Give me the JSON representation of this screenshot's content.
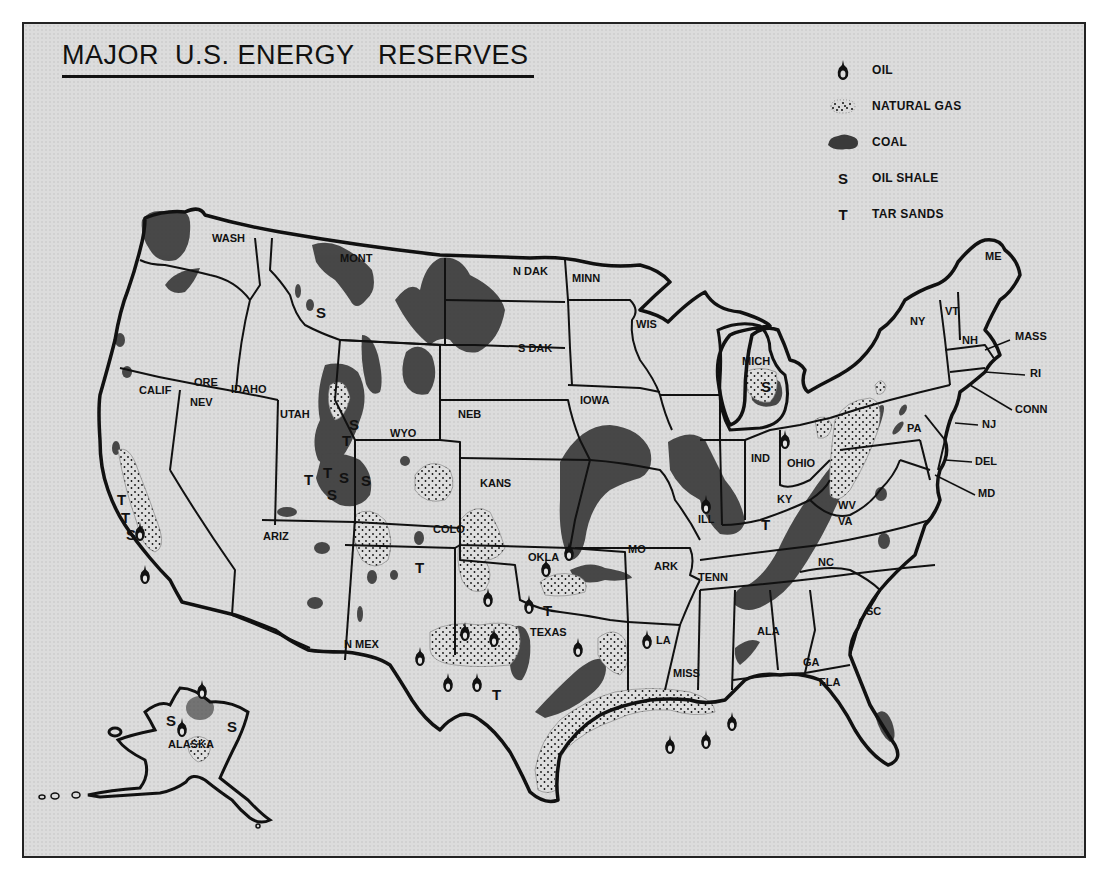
{
  "title": "MAJOR  U.S. ENERGY   RESERVES",
  "legend": {
    "items": [
      {
        "symbol": "oil-drop",
        "label": "OIL"
      },
      {
        "symbol": "dots",
        "label": "NATURAL GAS"
      },
      {
        "symbol": "dark-blob",
        "label": "COAL"
      },
      {
        "symbol": "S",
        "label": "OIL  SHALE"
      },
      {
        "symbol": "T",
        "label": "TAR SANDS"
      }
    ]
  },
  "states": [
    {
      "label": "WASH",
      "x": 212,
      "y": 242
    },
    {
      "label": "MONT",
      "x": 340,
      "y": 262
    },
    {
      "label": "N DAK",
      "x": 513,
      "y": 275
    },
    {
      "label": "MINN",
      "x": 572,
      "y": 282
    },
    {
      "label": "ORE",
      "x": 194,
      "y": 386
    },
    {
      "label": "IDAHO",
      "x": 231,
      "y": 393
    },
    {
      "label": "CALIF",
      "x": 139,
      "y": 394
    },
    {
      "label": "NEV",
      "x": 190,
      "y": 406
    },
    {
      "label": "UTAH",
      "x": 280,
      "y": 418
    },
    {
      "label": "WYO",
      "x": 390,
      "y": 437
    },
    {
      "label": "NEB",
      "x": 458,
      "y": 418
    },
    {
      "label": "S DAK",
      "x": 518,
      "y": 352
    },
    {
      "label": "IOWA",
      "x": 580,
      "y": 404
    },
    {
      "label": "WIS",
      "x": 636,
      "y": 328
    },
    {
      "label": "MICH",
      "x": 742,
      "y": 365
    },
    {
      "label": "NY",
      "x": 910,
      "y": 325
    },
    {
      "label": "VT",
      "x": 945,
      "y": 315
    },
    {
      "label": "NH",
      "x": 962,
      "y": 344
    },
    {
      "label": "ME",
      "x": 985,
      "y": 260
    },
    {
      "label": "MASS",
      "x": 1015,
      "y": 340
    },
    {
      "label": "RI",
      "x": 1030,
      "y": 377
    },
    {
      "label": "CONN",
      "x": 1015,
      "y": 413
    },
    {
      "label": "NJ",
      "x": 982,
      "y": 428
    },
    {
      "label": "DEL",
      "x": 975,
      "y": 465
    },
    {
      "label": "MD",
      "x": 978,
      "y": 497
    },
    {
      "label": "PA",
      "x": 907,
      "y": 432
    },
    {
      "label": "OHIO",
      "x": 787,
      "y": 467
    },
    {
      "label": "IND",
      "x": 751,
      "y": 462
    },
    {
      "label": "ILL",
      "x": 698,
      "y": 523
    },
    {
      "label": "KY",
      "x": 777,
      "y": 503
    },
    {
      "label": "WV",
      "x": 838,
      "y": 509
    },
    {
      "label": "VA",
      "x": 838,
      "y": 525
    },
    {
      "label": "KANS",
      "x": 480,
      "y": 487
    },
    {
      "label": "COLO",
      "x": 433,
      "y": 533
    },
    {
      "label": "OKLA",
      "x": 528,
      "y": 561
    },
    {
      "label": "MO",
      "x": 628,
      "y": 553
    },
    {
      "label": "ARK",
      "x": 654,
      "y": 570
    },
    {
      "label": "TENN",
      "x": 698,
      "y": 581
    },
    {
      "label": "NC",
      "x": 818,
      "y": 566
    },
    {
      "label": "SC",
      "x": 866,
      "y": 615
    },
    {
      "label": "ARIZ",
      "x": 263,
      "y": 540
    },
    {
      "label": "N MEX",
      "x": 344,
      "y": 648
    },
    {
      "label": "TEXAS",
      "x": 530,
      "y": 636
    },
    {
      "label": "LA",
      "x": 656,
      "y": 644
    },
    {
      "label": "MISS",
      "x": 673,
      "y": 677
    },
    {
      "label": "ALA",
      "x": 757,
      "y": 635
    },
    {
      "label": "GA",
      "x": 803,
      "y": 666
    },
    {
      "label": "FLA",
      "x": 819,
      "y": 686
    },
    {
      "label": "ALASKA",
      "x": 168,
      "y": 748
    }
  ],
  "oil_shale_markers": [
    {
      "x": 322,
      "y": 313
    },
    {
      "x": 355,
      "y": 425
    },
    {
      "x": 344,
      "y": 478
    },
    {
      "x": 366,
      "y": 482
    },
    {
      "x": 332,
      "y": 496
    },
    {
      "x": 767,
      "y": 387
    },
    {
      "x": 130,
      "y": 535
    },
    {
      "x": 170,
      "y": 721
    },
    {
      "x": 232,
      "y": 727
    }
  ],
  "tar_sands_markers": [
    {
      "x": 352,
      "y": 442
    },
    {
      "x": 310,
      "y": 480
    },
    {
      "x": 328,
      "y": 474
    },
    {
      "x": 122,
      "y": 500
    },
    {
      "x": 126,
      "y": 518
    },
    {
      "x": 420,
      "y": 568
    },
    {
      "x": 549,
      "y": 612
    },
    {
      "x": 497,
      "y": 695
    },
    {
      "x": 766,
      "y": 525
    }
  ],
  "oil_markers": [
    {
      "x": 145,
      "y": 575
    },
    {
      "x": 140,
      "y": 532
    },
    {
      "x": 488,
      "y": 598
    },
    {
      "x": 546,
      "y": 568
    },
    {
      "x": 529,
      "y": 605
    },
    {
      "x": 569,
      "y": 552
    },
    {
      "x": 465,
      "y": 632
    },
    {
      "x": 494,
      "y": 638
    },
    {
      "x": 420,
      "y": 657
    },
    {
      "x": 448,
      "y": 683
    },
    {
      "x": 477,
      "y": 683
    },
    {
      "x": 578,
      "y": 648
    },
    {
      "x": 647,
      "y": 640
    },
    {
      "x": 706,
      "y": 505
    },
    {
      "x": 785,
      "y": 440
    },
    {
      "x": 670,
      "y": 745
    },
    {
      "x": 706,
      "y": 740
    },
    {
      "x": 732,
      "y": 722
    },
    {
      "x": 182,
      "y": 728
    },
    {
      "x": 202,
      "y": 690
    }
  ]
}
